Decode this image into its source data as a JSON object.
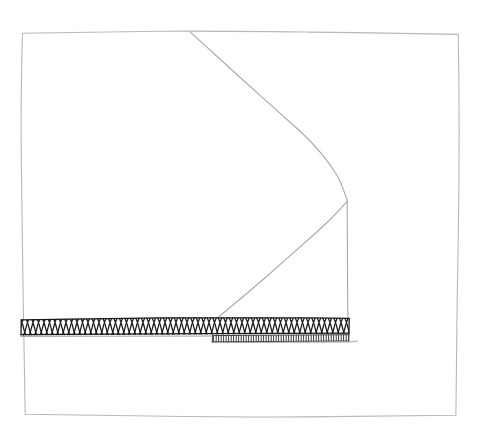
{
  "document": {
    "title": "Hand-drawn sectional sketch",
    "width": 480,
    "height": 431,
    "background_color": "#ffffff"
  },
  "style": {
    "frame_stroke_color": "#b8b8b8",
    "frame_stroke_width": 1.1,
    "fold_stroke_color": "#a9a9a9",
    "fold_stroke_width": 1.1,
    "hatch_stroke_color": "#1a1a1a",
    "hatch_stroke_width": 1.25,
    "hatch_fill_color": "#ffffff",
    "dashed_stroke_color": "#2b2b2b",
    "dashed_stroke_width": 0.9
  },
  "geometry": {
    "frame": {
      "name": "outer-border-rectangle",
      "points": "22,33 160,31 300,32 458,34 459,170 457,300 456,415 300,417 150,416 25,414 23,300 21,160"
    },
    "fold_upper_diagonal": {
      "name": "upper-fold-edge",
      "points": "190,32 250,85 300,130 330,172 347,200"
    },
    "fold_lower_diagonal": {
      "name": "lower-fold-edge",
      "points": "347,201 320,227 275,268 232,306 214,321"
    },
    "fold_vertical": {
      "name": "vertical-fold-edge",
      "points": "347,200 347,250 347,300 348,321"
    },
    "hatch_band_primary": {
      "name": "primary-hatched-band",
      "x_start": 21,
      "x_end": 349,
      "y_top": 317,
      "y_bottom": 334,
      "cell_width": 11.0
    },
    "hatch_band_secondary": {
      "name": "secondary-hatched-strip",
      "x_start": 212,
      "x_end": 349,
      "y_top": 334,
      "y_bottom": 341
    },
    "baseline_left": {
      "name": "band-baseline-left",
      "points": "21,336 120,336 212,336"
    },
    "baseline_right": {
      "name": "band-baseline-right",
      "points": "212,342 280,342 349,341"
    }
  },
  "labels": {
    "caption": "",
    "annotations": []
  }
}
